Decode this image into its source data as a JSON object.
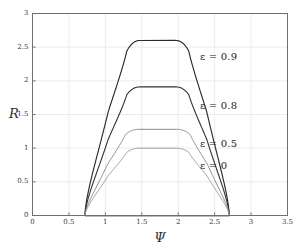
{
  "chart_data": {
    "type": "line",
    "title": "",
    "xlabel": "Ψ",
    "ylabel": "R",
    "xlim": [
      0,
      3.5
    ],
    "ylim": [
      0,
      3
    ],
    "xticks": [
      0,
      0.5,
      1,
      1.5,
      2,
      2.5,
      3,
      3.5
    ],
    "xtick_labels": [
      "0",
      "0.5",
      "1",
      "1.5",
      "2",
      "2.5",
      "3",
      "3.5"
    ],
    "yticks": [
      0,
      0.5,
      1,
      1.5,
      2,
      2.5,
      3
    ],
    "ytick_labels": [
      "0",
      "0.5",
      "1",
      "1.5",
      "2",
      "2.5",
      "3"
    ],
    "grid": true,
    "legend_position": "inline-annotations",
    "common_endpoints": [
      {
        "psi": 0.72,
        "R": 0
      },
      {
        "psi": 2.7,
        "R": 0
      }
    ],
    "series": [
      {
        "name": "ε = 0.9",
        "epsilon": 0.9,
        "color": "#2b2b2b",
        "linewidth": 1.15,
        "peak_R": 2.6,
        "peak_psi": 1.72,
        "half_width_psi": 0.4,
        "label_psi": 2.3,
        "label_R": 2.36
      },
      {
        "name": "ε = 0.8",
        "epsilon": 0.8,
        "color": "#333333",
        "linewidth": 1.1,
        "peak_R": 1.91,
        "peak_psi": 1.72,
        "half_width_psi": 0.4,
        "label_psi": 2.3,
        "label_R": 1.62
      },
      {
        "name": "ε = 0.5",
        "epsilon": 0.5,
        "color": "#8a8a8a",
        "linewidth": 1.0,
        "peak_R": 1.28,
        "peak_psi": 1.72,
        "half_width_psi": 0.42,
        "label_psi": 2.3,
        "label_R": 1.06
      },
      {
        "name": "ε = 0",
        "epsilon": 0,
        "color": "#9a9a9a",
        "linewidth": 1.0,
        "peak_R": 1.0,
        "peak_psi": 1.72,
        "half_width_psi": 0.4,
        "label_psi": 2.3,
        "label_R": 0.74
      }
    ]
  },
  "axes": {
    "x_title": "Ψ",
    "y_title": "R"
  },
  "labels": {
    "eps_09": "ε = 0.9",
    "eps_08": "ε = 0.8",
    "eps_05": "ε = 0.5",
    "eps_00": "ε = 0"
  },
  "colors": {
    "background": "#ffffff",
    "frame": "#6f6f6f",
    "grid": "#e3e3e8",
    "dark_curve": "#2b2b2b",
    "light_curve": "#9a9a9a",
    "text": "#2e2e2e"
  }
}
